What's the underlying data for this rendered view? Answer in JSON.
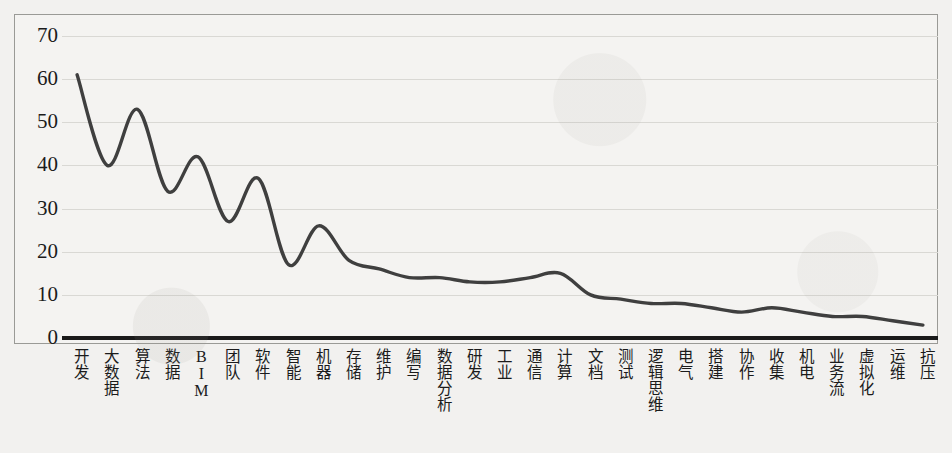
{
  "chart_data": {
    "type": "line",
    "title": "",
    "xlabel": "",
    "ylabel": "",
    "ylim": [
      0,
      70
    ],
    "yticks": [
      70,
      60,
      50,
      40,
      30,
      20,
      10,
      0
    ],
    "grid": true,
    "legend": "none",
    "line_color": "#3f3f3f",
    "baseline_color": "#1a1a1a",
    "gridline_color": "#d9d8d4",
    "background_color": "#f4f3f1",
    "categories": [
      "开发",
      "大数据",
      "算法",
      "数据",
      "BIM",
      "团队",
      "软件",
      "智能",
      "机器",
      "存储",
      "维护",
      "编写",
      "数据分析",
      "研发",
      "工业",
      "通信",
      "计算",
      "文档",
      "测试",
      "逻辑思维",
      "电气",
      "搭建",
      "协作",
      "收集",
      "机电",
      "业务流",
      "虚拟化",
      "运维",
      "抗压"
    ],
    "values": [
      61,
      40,
      53,
      34,
      42,
      27,
      37,
      17,
      26,
      18,
      16,
      14,
      14,
      13,
      13,
      14,
      15,
      10,
      9,
      8,
      8,
      7,
      6,
      7,
      6,
      5,
      5,
      4,
      3
    ],
    "series": [
      {
        "name": "关键词频次",
        "values": [
          61,
          40,
          53,
          34,
          42,
          27,
          37,
          17,
          26,
          18,
          16,
          14,
          14,
          13,
          13,
          14,
          15,
          10,
          9,
          8,
          8,
          7,
          6,
          7,
          6,
          5,
          5,
          4,
          3
        ]
      }
    ]
  }
}
